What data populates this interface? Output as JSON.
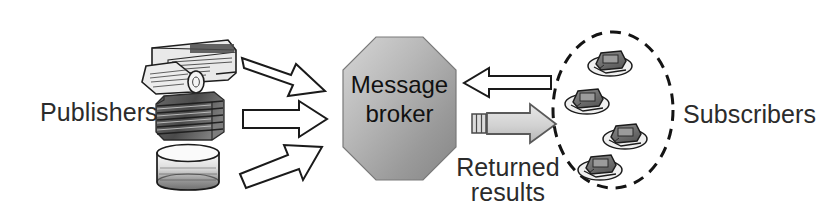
{
  "diagram": {
    "background_color": "#ffffff",
    "text_color": "#2b2b2b",
    "labels": {
      "publishers": "Publishers",
      "subscribers": "Subscribers",
      "returned_results": "Returned results",
      "broker_line1": "Message",
      "broker_line2": "broker"
    },
    "broker": {
      "shape": "octagon",
      "fill_light": "#cfcfcf",
      "fill_dark": "#8f8f8f",
      "stroke": "#6e6e6e",
      "x": 343,
      "y": 37,
      "width": 113,
      "height": 143
    },
    "subscriber_group": {
      "shape": "dashed-ellipse",
      "stroke": "#1a1a1a",
      "dash": "11 8",
      "cx": 613,
      "cy": 110,
      "rx": 60,
      "ry": 78,
      "count": 4
    },
    "publisher_sources": [
      {
        "icon": "newspaper-icon",
        "label": "newspaper"
      },
      {
        "icon": "document-stack-icon",
        "label": "document stack"
      },
      {
        "icon": "database-cylinder-icon",
        "label": "database cylinder"
      }
    ],
    "arrows": [
      {
        "name": "publisher-arrow-top",
        "direction": "right-down",
        "fill": "#ffffff",
        "stroke": "#1a1a1a"
      },
      {
        "name": "publisher-arrow-middle",
        "direction": "right",
        "fill": "#ffffff",
        "stroke": "#1a1a1a"
      },
      {
        "name": "publisher-arrow-bottom",
        "direction": "right-up",
        "fill": "#ffffff",
        "stroke": "#1a1a1a"
      },
      {
        "name": "subscribe-request-arrow",
        "direction": "left",
        "fill": "#ffffff",
        "stroke": "#1a1a1a"
      },
      {
        "name": "returned-results-arrow",
        "direction": "right",
        "fill": "#d4d4d4",
        "stroke": "#555555"
      }
    ]
  }
}
